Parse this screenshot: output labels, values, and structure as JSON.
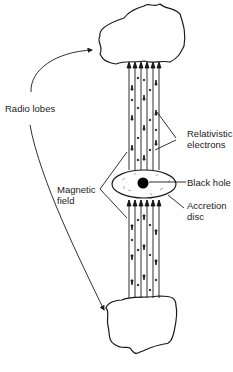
{
  "diagram": {
    "colors": {
      "ink": "#1a1a1a",
      "background": "#ffffff"
    },
    "labels": {
      "radio_lobes": "Radio lobes",
      "relativistic_line1": "Relativistic",
      "relativistic_line2": "electrons",
      "black_hole": "Black hole",
      "accretion_line1": "Accretion",
      "accretion_line2": "disc",
      "magnetic_line1": "Magnetic",
      "magnetic_line2": "field"
    },
    "components": [
      {
        "name": "upper-radio-lobe",
        "shape": "cloud"
      },
      {
        "name": "lower-radio-lobe",
        "shape": "cloud"
      },
      {
        "name": "upper-jet",
        "field_lines": 7,
        "direction": "up"
      },
      {
        "name": "lower-jet",
        "field_lines": 7,
        "direction": "down"
      },
      {
        "name": "accretion-disc",
        "shape": "ellipse"
      },
      {
        "name": "black-hole",
        "shape": "filled-circle"
      }
    ]
  }
}
